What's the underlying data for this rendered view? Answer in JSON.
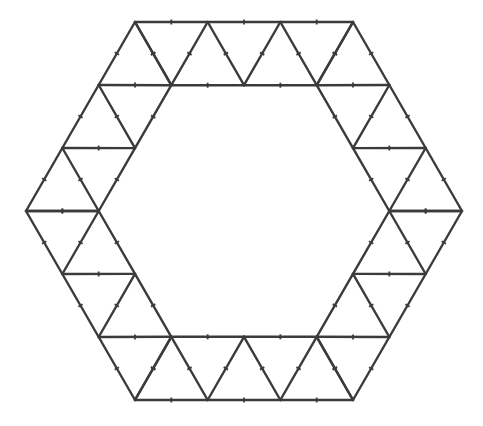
{
  "figure": {
    "type": "geometric-diagram",
    "background_color": "#ffffff",
    "stroke_color": "#3b3b3b",
    "stroke_width": 2.4,
    "tick_color": "#3b3b3b",
    "tick_width": 1.8,
    "tick_length": 5,
    "canvas": {
      "width": 483,
      "height": 426
    },
    "center": {
      "x": 244,
      "y": 211
    },
    "outer_hexagon": {
      "label": "outer-hexagon",
      "circumradius": 218,
      "orientation": "flat-top",
      "sides": 6,
      "divisions_per_side": 3,
      "vertices": [
        {
          "x": 462,
          "y": 211
        },
        {
          "x": 353,
          "y": 22
        },
        {
          "x": 135,
          "y": 22
        },
        {
          "x": 26,
          "y": 211
        },
        {
          "x": 135,
          "y": 400
        },
        {
          "x": 353,
          "y": 400
        }
      ]
    },
    "inner_hexagon": {
      "label": "inner-hexagon",
      "circumradius": 145.3,
      "orientation": "flat-top",
      "sides": 6,
      "divisions_per_side": 2,
      "vertices": [
        {
          "x": 389.3,
          "y": 211
        },
        {
          "x": 316.7,
          "y": 85.2
        },
        {
          "x": 171.3,
          "y": 85.2
        },
        {
          "x": 98.7,
          "y": 211
        },
        {
          "x": 171.3,
          "y": 336.8
        },
        {
          "x": 316.7,
          "y": 336.8
        }
      ]
    },
    "ring": {
      "label": "hexagonal-annulus",
      "band_triangles_total": 30,
      "band_triangles_per_side": 5,
      "triangle_pattern": "alternating up/down equilateral strip",
      "upward_triangles_per_side": 3,
      "downward_triangles_per_side": 2
    },
    "ticks": {
      "description": "short perpendicular hash mark at the midpoint of every segment",
      "per_segment": 1
    }
  }
}
